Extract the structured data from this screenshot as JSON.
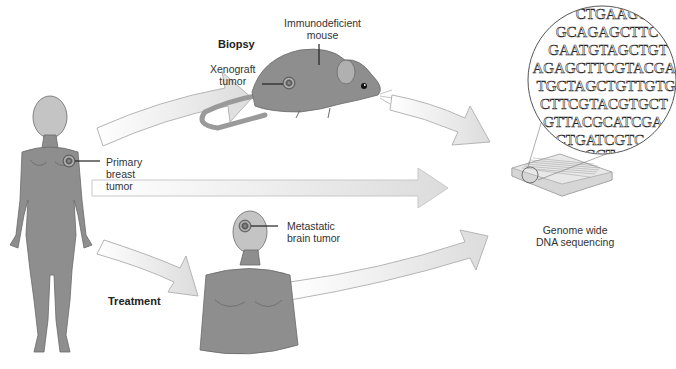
{
  "labels": {
    "biopsy": "Biopsy",
    "mouse_line1": "Immunodeficient",
    "mouse_line2": "mouse",
    "xenograft_line1": "Xenograft",
    "xenograft_line2": "tumor",
    "primary_line1": "Primary",
    "primary_line2": "breast",
    "primary_line3": "tumor",
    "metastatic_line1": "Metastatic",
    "metastatic_line2": "brain tumor",
    "treatment": "Treatment",
    "sequencing_line1": "Genome wide",
    "sequencing_line2": "DNA sequencing"
  },
  "dna_sequence_lines": [
    "CTGAAGC",
    "GCAGAGCTTC",
    "GAATGTAGCTGT",
    "AGAGCTTCGTACGA",
    "TGCTAGCTGTTGTG",
    "CTTCGTACGTGCT",
    "GTTACGCATCGA",
    "CTGATCGTC",
    "GCT"
  ],
  "colors": {
    "figure_gray": "#8a8a8a",
    "head_light": "#c8c8c8",
    "arrow_fill": "#e6e6e6",
    "arrow_stroke": "#b5b5b5",
    "tumor": "#555555"
  }
}
